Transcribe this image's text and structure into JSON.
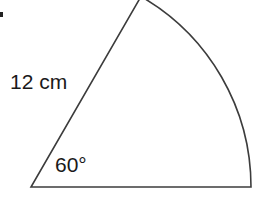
{
  "figure": {
    "type": "circular-sector",
    "labels": {
      "radius": "12 cm",
      "angle": "60°"
    },
    "values": {
      "radius_value": 12,
      "radius_unit": "cm",
      "angle_degrees": 60
    },
    "geometry": {
      "center_x": 31,
      "center_y": 187,
      "radius_px": 220,
      "start_angle_deg": 0,
      "end_angle_deg": 60,
      "base_end_x": 251,
      "base_end_y": 187,
      "arc_top_x": 141,
      "arc_top_y": -3
    },
    "style": {
      "stroke_color": "#3c3c3c",
      "stroke_width": 1.6,
      "fill_color": "#ffffff",
      "text_color": "#1a1a1a",
      "background_color": "#ffffff",
      "mark_color": "#222222"
    }
  }
}
